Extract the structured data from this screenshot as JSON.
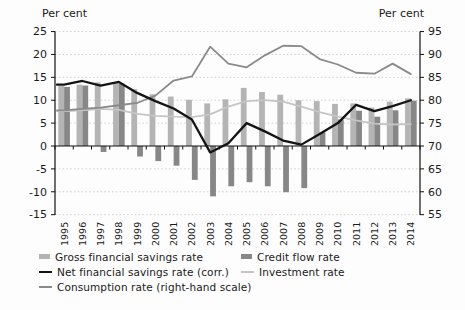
{
  "figure": {
    "ylabel_left": "Per cent",
    "ylabel_right": "Per cent"
  },
  "chart_data": {
    "type": "bar",
    "subtype": "bar-line combo, dual axis",
    "categories": [
      "1995",
      "1996",
      "1997",
      "1998",
      "1999",
      "2000",
      "2001",
      "2002",
      "2003",
      "2004",
      "2005",
      "2006",
      "2007",
      "2008",
      "2009",
      "2010",
      "2011",
      "2012",
      "2013",
      "2014"
    ],
    "series": [
      {
        "name": "Gross financial savings rate",
        "type": "bar",
        "axis": "left",
        "color": "#b4b4b4",
        "values": [
          13.1,
          13.4,
          13.9,
          13.9,
          12.4,
          11.3,
          10.8,
          10.1,
          9.3,
          10.2,
          12.7,
          11.8,
          11.2,
          10.0,
          9.8,
          9.2,
          9.3,
          8.4,
          9.7,
          10.4
        ]
      },
      {
        "name": "Credit flow rate",
        "type": "bar",
        "axis": "left",
        "color": "#878787",
        "values": [
          12.9,
          13.2,
          -1.3,
          13.6,
          -2.3,
          -3.3,
          -4.3,
          -7.4,
          -11.0,
          -8.8,
          -7.9,
          -8.8,
          -10.1,
          -9.2,
          3.0,
          5.8,
          7.7,
          6.4,
          7.8,
          9.9
        ]
      },
      {
        "name": "Net financial savings rate (corr.)",
        "type": "line",
        "axis": "left",
        "color": "#141414",
        "values": [
          13.4,
          14.2,
          13.2,
          14.0,
          11.6,
          9.8,
          8.2,
          5.8,
          -1.4,
          0.6,
          5.0,
          3.2,
          1.2,
          0.3,
          2.6,
          5.0,
          9.0,
          7.6,
          8.7,
          10.0
        ]
      },
      {
        "name": "Investment rate",
        "type": "line",
        "axis": "left",
        "color": "#c5c5c5",
        "values": [
          7.6,
          7.8,
          8.1,
          7.9,
          7.0,
          6.6,
          6.4,
          6.3,
          6.9,
          8.6,
          9.8,
          10.0,
          9.7,
          8.6,
          7.4,
          6.4,
          5.6,
          4.9,
          4.7,
          4.8
        ]
      },
      {
        "name": "Consumption rate (right-hand scale)",
        "type": "line",
        "axis": "right",
        "color": "#8a8a8a",
        "values": [
          77.8,
          78.1,
          78.4,
          78.9,
          79.4,
          81.0,
          84.3,
          85.2,
          91.7,
          88.0,
          87.2,
          89.8,
          91.9,
          91.8,
          89.0,
          87.8,
          86.0,
          85.8,
          88.0,
          85.7
        ]
      }
    ],
    "left_axis": {
      "label": "Per cent",
      "min": -15,
      "max": 25,
      "step": 5
    },
    "right_axis": {
      "label": "Per cent",
      "min": 55,
      "max": 95,
      "step": 5
    },
    "grid": "dotted horizontal gridlines at every 5 units; solid black zero line with year tick marks",
    "legend_position": "bottom-left, two columns"
  }
}
